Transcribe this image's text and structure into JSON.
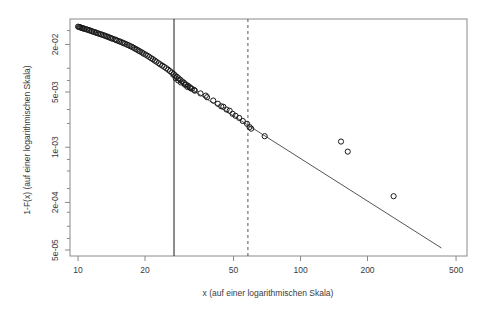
{
  "chart_data": {
    "type": "scatter",
    "title": "",
    "subtitle": "",
    "xlabel": "x (auf einer logarithmischen Skala)",
    "ylabel": "1-F(x) (auf einer logarithmischen Skala)",
    "xscale": "log",
    "yscale": "log",
    "xlim": [
      9.2,
      560
    ],
    "ylim": [
      4.2e-05,
      0.042
    ],
    "grid": false,
    "legend": null,
    "x_ticks": [
      {
        "value": 10,
        "label": "10"
      },
      {
        "value": 20,
        "label": "20"
      },
      {
        "value": 50,
        "label": "50"
      },
      {
        "value": 100,
        "label": "100"
      },
      {
        "value": 200,
        "label": "200"
      },
      {
        "value": 500,
        "label": "500"
      }
    ],
    "y_ticks": [
      {
        "value": 0.02,
        "label": "2e-02"
      },
      {
        "value": 0.005,
        "label": "5e-03"
      },
      {
        "value": 0.001,
        "label": "1e-03"
      },
      {
        "value": 0.0002,
        "label": "2e-04"
      },
      {
        "value": 5e-05,
        "label": "5e-05"
      }
    ],
    "y_minor_ticks": [
      0.03,
      0.01,
      0.007,
      0.003,
      0.002,
      0.0007,
      0.0005,
      0.0003,
      0.00015,
      0.0001,
      7e-05
    ],
    "series": [
      {
        "name": "empirische Ueberlebensfunktion",
        "type": "scatter",
        "marker": "open-circle",
        "color": "#1a1a1a",
        "points": [
          [
            10.0,
            0.0336
          ],
          [
            10.1,
            0.0333
          ],
          [
            10.2,
            0.033
          ],
          [
            10.3,
            0.0327
          ],
          [
            10.4,
            0.0324
          ],
          [
            10.5,
            0.0321
          ],
          [
            10.6,
            0.0318
          ],
          [
            10.7,
            0.0315
          ],
          [
            10.9,
            0.0311
          ],
          [
            11.0,
            0.0308
          ],
          [
            11.2,
            0.0304
          ],
          [
            11.3,
            0.03
          ],
          [
            11.5,
            0.0296
          ],
          [
            11.6,
            0.0292
          ],
          [
            11.8,
            0.0288
          ],
          [
            12.0,
            0.0284
          ],
          [
            12.1,
            0.028
          ],
          [
            12.3,
            0.0276
          ],
          [
            12.5,
            0.0272
          ],
          [
            12.7,
            0.0268
          ],
          [
            12.9,
            0.0264
          ],
          [
            13.1,
            0.026
          ],
          [
            13.3,
            0.0256
          ],
          [
            13.5,
            0.0252
          ],
          [
            13.7,
            0.0248
          ],
          [
            13.9,
            0.0244
          ],
          [
            14.1,
            0.024
          ],
          [
            14.3,
            0.0236
          ],
          [
            14.6,
            0.0232
          ],
          [
            14.8,
            0.0228
          ],
          [
            15.0,
            0.0224
          ],
          [
            15.3,
            0.022
          ],
          [
            15.5,
            0.0216
          ],
          [
            15.8,
            0.0212
          ],
          [
            16.0,
            0.0208
          ],
          [
            16.3,
            0.0204
          ],
          [
            16.6,
            0.0199
          ],
          [
            16.9,
            0.0195
          ],
          [
            17.2,
            0.019
          ],
          [
            17.5,
            0.0186
          ],
          [
            17.8,
            0.0181
          ],
          [
            18.1,
            0.0176
          ],
          [
            18.4,
            0.0172
          ],
          [
            18.7,
            0.0167
          ],
          [
            19.0,
            0.0163
          ],
          [
            19.4,
            0.0158
          ],
          [
            19.7,
            0.0153
          ],
          [
            20.1,
            0.0149
          ],
          [
            20.5,
            0.0144
          ],
          [
            20.9,
            0.0139
          ],
          [
            21.3,
            0.0134
          ],
          [
            21.7,
            0.013
          ],
          [
            22.1,
            0.0125
          ],
          [
            22.5,
            0.0121
          ],
          [
            23.0,
            0.0116
          ],
          [
            23.4,
            0.0112
          ],
          [
            23.9,
            0.0108
          ],
          [
            24.4,
            0.0104
          ],
          [
            24.9,
            0.01
          ],
          [
            25.4,
            0.0096
          ],
          [
            25.9,
            0.0092
          ],
          [
            26.4,
            0.0088
          ],
          [
            26.9,
            0.00845
          ],
          [
            27.3,
            0.0081
          ],
          [
            27.8,
            0.0078
          ],
          [
            28.3,
            0.00745
          ],
          [
            28.8,
            0.00715
          ],
          [
            29.4,
            0.0068
          ],
          [
            29.9,
            0.00655
          ],
          [
            30.5,
            0.00625
          ],
          [
            31.2,
            0.006
          ],
          [
            31.8,
            0.00575
          ],
          [
            32.5,
            0.0055
          ],
          [
            33.3,
            0.0053
          ],
          [
            27.5,
            0.00745
          ],
          [
            28.2,
            0.007
          ],
          [
            29.0,
            0.0066
          ],
          [
            30.2,
            0.0062
          ],
          [
            31.0,
            0.0058
          ],
          [
            32.0,
            0.0056
          ],
          [
            33.5,
            0.0052
          ],
          [
            35.5,
            0.0048
          ],
          [
            37.5,
            0.0045
          ],
          [
            38.0,
            0.0043
          ],
          [
            40.5,
            0.0039
          ],
          [
            42.5,
            0.00355
          ],
          [
            44.0,
            0.0033
          ],
          [
            45.0,
            0.00325
          ],
          [
            46.5,
            0.003
          ],
          [
            48.0,
            0.0029
          ],
          [
            49.5,
            0.00265
          ],
          [
            51.0,
            0.0025
          ],
          [
            53.0,
            0.00235
          ],
          [
            55.0,
            0.00215
          ],
          [
            57.5,
            0.00198
          ],
          [
            59.0,
            0.0018
          ],
          [
            60.0,
            0.00172
          ],
          [
            69.0,
            0.00138
          ],
          [
            152.0,
            0.00118
          ],
          [
            163.0,
            0.00088
          ],
          [
            262.0,
            0.00024
          ]
        ]
      }
    ],
    "fit_line": {
      "name": "angepasste Pareto-Gerade",
      "color": "#555555",
      "x_start": 26.0,
      "y_start": 0.008,
      "x_end": 430.0,
      "y_end": 5.3e-05
    },
    "reference_lines": [
      {
        "name": "solid-threshold",
        "orientation": "vertical",
        "x": 27.0,
        "style": "solid",
        "color": "#1a1a1a"
      },
      {
        "name": "dashed-threshold",
        "orientation": "vertical",
        "x": 58.0,
        "style": "dashed",
        "color": "#555555"
      }
    ]
  }
}
